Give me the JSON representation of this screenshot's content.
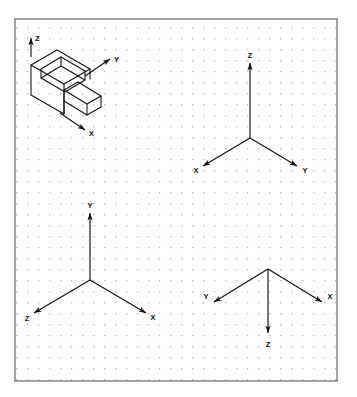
{
  "figure": {
    "background_color": "#ffffff",
    "border_color": "#5a5a5a",
    "grid": {
      "type": "dot-grid",
      "dot_color": "#b9b2b2",
      "spacing_px": 11,
      "visible": true
    },
    "line_color": "#111111"
  },
  "panels": {
    "isometric_object": {
      "name": "L-shaped isometric block",
      "axes": [
        {
          "label": "Z",
          "direction": "up"
        },
        {
          "label": "Y",
          "direction": "up-right"
        },
        {
          "label": "X",
          "direction": "down-right"
        }
      ]
    },
    "triad_top_right": {
      "name": "axis triad top right",
      "axes": [
        {
          "label": "Z",
          "direction": "up"
        },
        {
          "label": "X",
          "direction": "down-left"
        },
        {
          "label": "Y",
          "direction": "down-right"
        }
      ]
    },
    "triad_bottom_left": {
      "name": "axis triad bottom left",
      "axes": [
        {
          "label": "Y",
          "direction": "up"
        },
        {
          "label": "Z",
          "direction": "down-left"
        },
        {
          "label": "X",
          "direction": "down-right"
        }
      ]
    },
    "triad_bottom_right": {
      "name": "axis triad bottom right",
      "axes": [
        {
          "label": "Z",
          "direction": "down"
        },
        {
          "label": "Y",
          "direction": "up-left"
        },
        {
          "label": "X",
          "direction": "up-right"
        }
      ]
    }
  },
  "labels": {
    "iso_z": "Z",
    "iso_y": "Y",
    "iso_x": "X",
    "tr_z": "Z",
    "tr_x": "X",
    "tr_y": "Y",
    "bl_y": "Y",
    "bl_z": "Z",
    "bl_x": "X",
    "br_z": "Z",
    "br_y": "Y",
    "br_x": "X"
  }
}
